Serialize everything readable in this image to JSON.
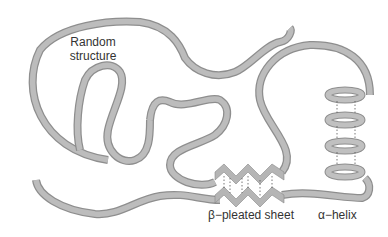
{
  "diagram": {
    "labels": {
      "random": "Random\nstructure",
      "random_line1": "Random",
      "random_line2": "structure",
      "sheet": "β−pleated sheet",
      "helix": "α−helix"
    },
    "colors": {
      "ribbon_edge": "#8e8e8e",
      "ribbon_face": "#bcbcbc",
      "hbond": "#555555",
      "text": "#333333",
      "background": "#ffffff"
    },
    "elements": [
      {
        "type": "random-coil",
        "label": "Random structure"
      },
      {
        "type": "beta-pleated-sheet",
        "label": "β−pleated sheet",
        "strands": 2,
        "hbonds": 6
      },
      {
        "type": "alpha-helix",
        "label": "α−helix",
        "turns": 4
      }
    ]
  }
}
